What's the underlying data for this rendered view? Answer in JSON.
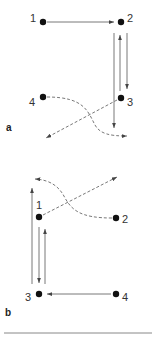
{
  "panels": [
    {
      "label": "a",
      "nodes": [
        {
          "id": "1",
          "label": "1",
          "x": 43,
          "y": 22
        },
        {
          "id": "2",
          "label": "2",
          "x": 121,
          "y": 22
        },
        {
          "id": "3",
          "label": "3",
          "x": 121,
          "y": 98
        },
        {
          "id": "4",
          "label": "4",
          "x": 43,
          "y": 97
        }
      ],
      "edges": [
        {
          "from": "1",
          "to": "2",
          "style": "solid"
        },
        {
          "from": "2",
          "to": "3",
          "style": "solid"
        },
        {
          "from": "3",
          "to": "2",
          "style": "solid"
        },
        {
          "from": "2",
          "to": "below-3",
          "style": "solid"
        },
        {
          "from": "4",
          "to": "exit-right",
          "style": "dashed"
        },
        {
          "from": "3",
          "to": "exit-left",
          "style": "dashed"
        }
      ]
    },
    {
      "label": "b",
      "nodes": [
        {
          "id": "1",
          "label": "1",
          "x": 39,
          "y": 217
        },
        {
          "id": "2",
          "label": "2",
          "x": 116,
          "y": 218
        },
        {
          "id": "3",
          "label": "3",
          "x": 39,
          "y": 294
        },
        {
          "id": "4",
          "label": "4",
          "x": 116,
          "y": 294
        }
      ],
      "edges": [
        {
          "from": "4",
          "to": "3",
          "style": "solid"
        },
        {
          "from": "1",
          "to": "3",
          "style": "solid"
        },
        {
          "from": "3",
          "to": "1",
          "style": "solid"
        },
        {
          "from": "3",
          "to": "above-1",
          "style": "solid"
        },
        {
          "from": "2",
          "to": "exit-left",
          "style": "dashed"
        },
        {
          "from": "1",
          "to": "exit-right",
          "style": "dashed"
        }
      ]
    }
  ],
  "colors": {
    "line": "#555555",
    "node": "#111111",
    "separator": "#888888"
  }
}
